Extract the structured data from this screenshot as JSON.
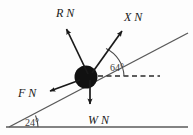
{
  "figure": {
    "kind": "free-body-diagram",
    "background_color": "#fdfdfd",
    "ink_color": "#1a1a1a",
    "line_color": "#4a4a4a"
  },
  "forces": [
    {
      "id": "R",
      "symbol": "R",
      "unit": "N",
      "label": "R N",
      "direction": "up-left (normal to incline)",
      "tail": {
        "x": 88,
        "y": 74
      },
      "tip": {
        "x": 64,
        "y": 24
      }
    },
    {
      "id": "X",
      "symbol": "X",
      "unit": "N",
      "label": "X N",
      "direction": "up-right",
      "tail": {
        "x": 92,
        "y": 73
      },
      "tip": {
        "x": 124,
        "y": 28
      }
    },
    {
      "id": "F",
      "symbol": "F",
      "unit": "N",
      "label": "F N",
      "direction": "down-left (along incline)",
      "tail": {
        "x": 80,
        "y": 80
      },
      "tip": {
        "x": 47,
        "y": 92
      }
    },
    {
      "id": "W",
      "symbol": "W",
      "unit": "N",
      "label": "W N",
      "direction": "straight down (weight)",
      "tail": {
        "x": 90,
        "y": 80
      },
      "tip": {
        "x": 90,
        "y": 109
      }
    }
  ],
  "angles": [
    {
      "id": "theta-x",
      "value": "64",
      "degree_symbol": "°",
      "label": "64°",
      "between": "X vector and horizontal dashed line",
      "vertex": {
        "x": 92,
        "y": 74
      }
    },
    {
      "id": "theta-incline",
      "value": "24",
      "degree_symbol": "°",
      "label": "24°",
      "between": "incline and horizontal ground",
      "vertex": {
        "x": 9,
        "y": 127
      }
    }
  ],
  "geometry": {
    "incline": {
      "x1": 9,
      "y1": 127,
      "x2": 188,
      "y2": 33
    },
    "ground": {
      "x1": 6,
      "y1": 127,
      "x2": 188,
      "y2": 127
    },
    "dashed_horizontal": {
      "x1": 98,
      "y1": 76,
      "x2": 160,
      "y2": 76
    },
    "block": {
      "cx": 86,
      "cy": 77,
      "r": 11,
      "fill": "#111111"
    }
  }
}
